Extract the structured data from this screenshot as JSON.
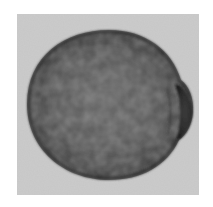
{
  "image": {
    "subject": "seed",
    "description": "Grayscale photograph of a single rounded seed with mottled surface texture and a dark hilum on the right side",
    "colors": {
      "page_background": "#ffffff",
      "photo_background": "#c4c4c4",
      "seed_light": "#6e6e6e",
      "seed_mid": "#565656",
      "seed_dark": "#2e2e2e",
      "hilum": "#1e1e1e"
    }
  }
}
